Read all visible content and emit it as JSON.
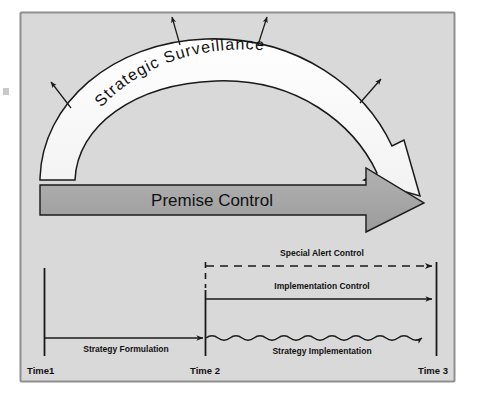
{
  "figure": {
    "panel": {
      "background_color": "#d9d9d9",
      "border_color": "#8f8f8f",
      "outer_background": "#ffffff"
    },
    "curved_arrow": {
      "label": "Strategic  Surveillance",
      "fill_color": "#ffffff",
      "stroke_color": "#1a1a1a",
      "radiating_arrow_count": 4
    },
    "straight_arrow": {
      "label": "Premise Control",
      "fill_color": "#a6a6a6",
      "stroke_color": "#1a1a1a"
    },
    "timeline": {
      "axis_color": "#1a1a1a",
      "ticks": [
        {
          "name": "time1",
          "label": "Time1"
        },
        {
          "name": "time2",
          "label": "Time 2"
        },
        {
          "name": "time3",
          "label": "Time 3"
        }
      ],
      "flows": [
        {
          "name": "special-alert-control",
          "label": "Special Alert Control",
          "style": "dashed",
          "from": "Time 2",
          "to": "Time 3"
        },
        {
          "name": "implementation-control",
          "label": "Implementation Control",
          "style": "solid",
          "from": "Time 2",
          "to": "Time 3"
        },
        {
          "name": "strategy-formulation",
          "label": "Strategy Formulation",
          "style": "solid",
          "from": "Time1",
          "to": "Time 2"
        },
        {
          "name": "strategy-implementation",
          "label": "Strategy Implementation",
          "style": "wavy",
          "from": "Time 2",
          "to": "Time 3"
        }
      ]
    }
  }
}
